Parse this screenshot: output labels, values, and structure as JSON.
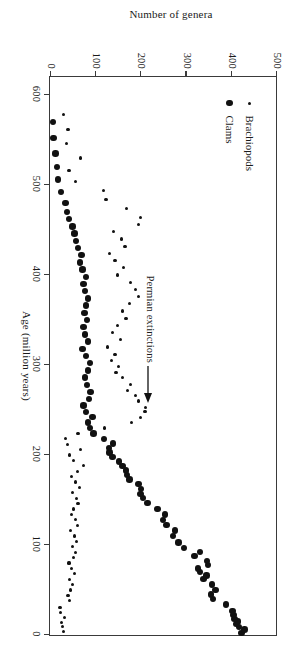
{
  "figure": {
    "rotation_degrees": 90,
    "legend": {
      "items": [
        {
          "label": "Brachiopods",
          "marker": "small-dot",
          "color": "#111111"
        },
        {
          "label": "Clams",
          "marker": "large-dot",
          "color": "#111111"
        }
      ]
    },
    "annotation": {
      "text": "Permian extinctions",
      "arrow": "arrow-right-icon",
      "points_to_age": 250
    }
  },
  "chart_data": {
    "type": "scatter",
    "title": "",
    "xlabel": "Age (million years)",
    "ylabel": "Number of genera",
    "xlim": [
      0,
      620
    ],
    "ylim": [
      0,
      500
    ],
    "xticks": [
      0,
      100,
      200,
      300,
      400,
      500,
      600
    ],
    "yticks": [
      0,
      100,
      200,
      300,
      400,
      500
    ],
    "xtick_labels": [
      "0",
      "100",
      "200",
      "300",
      "400",
      "500",
      "600"
    ],
    "ytick_labels": [
      "0",
      "100",
      "200",
      "300",
      "400",
      "500"
    ],
    "x_axis_reversed": true,
    "grid": false,
    "legend_position": "upper-left-inside",
    "series": [
      {
        "name": "Clams",
        "marker": "large-dot",
        "color": "#111111",
        "points": [
          [
            2,
            424
          ],
          [
            6,
            430
          ],
          [
            9,
            418
          ],
          [
            12,
            412
          ],
          [
            15,
            416
          ],
          [
            18,
            408
          ],
          [
            22,
            406
          ],
          [
            27,
            404
          ],
          [
            34,
            390
          ],
          [
            40,
            360
          ],
          [
            45,
            356
          ],
          [
            50,
            366
          ],
          [
            56,
            358
          ],
          [
            62,
            340
          ],
          [
            66,
            346
          ],
          [
            70,
            332
          ],
          [
            74,
            328
          ],
          [
            78,
            350
          ],
          [
            82,
            348
          ],
          [
            88,
            320
          ],
          [
            92,
            332
          ],
          [
            97,
            296
          ],
          [
            103,
            284
          ],
          [
            110,
            272
          ],
          [
            116,
            276
          ],
          [
            122,
            258
          ],
          [
            128,
            250
          ],
          [
            134,
            254
          ],
          [
            140,
            238
          ],
          [
            147,
            216
          ],
          [
            152,
            206
          ],
          [
            157,
            200
          ],
          [
            162,
            202
          ],
          [
            168,
            196
          ],
          [
            173,
            176
          ],
          [
            178,
            170
          ],
          [
            183,
            168
          ],
          [
            188,
            160
          ],
          [
            193,
            152
          ],
          [
            198,
            138
          ],
          [
            203,
            132
          ],
          [
            208,
            130
          ],
          [
            213,
            140
          ],
          [
            218,
            120
          ],
          [
            224,
            96
          ],
          [
            230,
            88
          ],
          [
            236,
            84
          ],
          [
            242,
            94
          ],
          [
            248,
            80
          ],
          [
            255,
            74
          ],
          [
            262,
            86
          ],
          [
            270,
            90
          ],
          [
            278,
            82
          ],
          [
            286,
            78
          ],
          [
            294,
            84
          ],
          [
            302,
            88
          ],
          [
            310,
            80
          ],
          [
            318,
            72
          ],
          [
            326,
            84
          ],
          [
            334,
            78
          ],
          [
            342,
            74
          ],
          [
            350,
            82
          ],
          [
            358,
            76
          ],
          [
            366,
            80
          ],
          [
            374,
            84
          ],
          [
            382,
            78
          ],
          [
            390,
            74
          ],
          [
            398,
            80
          ],
          [
            406,
            72
          ],
          [
            414,
            66
          ],
          [
            422,
            70
          ],
          [
            430,
            62
          ],
          [
            438,
            58
          ],
          [
            446,
            54
          ],
          [
            454,
            50
          ],
          [
            462,
            42
          ],
          [
            470,
            38
          ],
          [
            480,
            34
          ],
          [
            492,
            24
          ],
          [
            506,
            18
          ],
          [
            520,
            16
          ],
          [
            535,
            12
          ],
          [
            552,
            8
          ],
          [
            570,
            6
          ]
        ]
      },
      {
        "name": "Brachiopods",
        "marker": "small-dot",
        "color": "#111111",
        "points": [
          [
            4,
            30
          ],
          [
            9,
            28
          ],
          [
            14,
            26
          ],
          [
            19,
            32
          ],
          [
            25,
            24
          ],
          [
            31,
            22
          ],
          [
            38,
            44
          ],
          [
            44,
            40
          ],
          [
            50,
            46
          ],
          [
            56,
            50
          ],
          [
            62,
            44
          ],
          [
            68,
            54
          ],
          [
            74,
            48
          ],
          [
            80,
            42
          ],
          [
            86,
            52
          ],
          [
            92,
            56
          ],
          [
            98,
            50
          ],
          [
            104,
            58
          ],
          [
            110,
            54
          ],
          [
            116,
            46
          ],
          [
            122,
            60
          ],
          [
            128,
            56
          ],
          [
            134,
            48
          ],
          [
            140,
            52
          ],
          [
            146,
            62
          ],
          [
            152,
            58
          ],
          [
            158,
            50
          ],
          [
            164,
            66
          ],
          [
            170,
            56
          ],
          [
            176,
            48
          ],
          [
            182,
            60
          ],
          [
            188,
            74
          ],
          [
            194,
            52
          ],
          [
            200,
            44
          ],
          [
            206,
            68
          ],
          [
            212,
            38
          ],
          [
            218,
            34
          ],
          [
            224,
            62
          ],
          [
            230,
            120
          ],
          [
            236,
            180
          ],
          [
            242,
            200
          ],
          [
            248,
            210
          ],
          [
            253,
            212
          ],
          [
            260,
            196
          ],
          [
            266,
            190
          ],
          [
            272,
            172
          ],
          [
            278,
            178
          ],
          [
            286,
            160
          ],
          [
            292,
            146
          ],
          [
            298,
            152
          ],
          [
            305,
            136
          ],
          [
            312,
            144
          ],
          [
            320,
            128
          ],
          [
            328,
            156
          ],
          [
            336,
            138
          ],
          [
            344,
            150
          ],
          [
            352,
            168
          ],
          [
            360,
            160
          ],
          [
            368,
            176
          ],
          [
            376,
            196
          ],
          [
            384,
            190
          ],
          [
            392,
            178
          ],
          [
            400,
            150
          ],
          [
            408,
            162
          ],
          [
            416,
            144
          ],
          [
            424,
            132
          ],
          [
            432,
            166
          ],
          [
            440,
            158
          ],
          [
            448,
            140
          ],
          [
            456,
            196
          ],
          [
            464,
            200
          ],
          [
            474,
            170
          ],
          [
            484,
            124
          ],
          [
            494,
            118
          ],
          [
            504,
            56
          ],
          [
            516,
            42
          ],
          [
            530,
            68
          ],
          [
            546,
            36
          ],
          [
            562,
            40
          ],
          [
            578,
            30
          ]
        ]
      }
    ]
  }
}
